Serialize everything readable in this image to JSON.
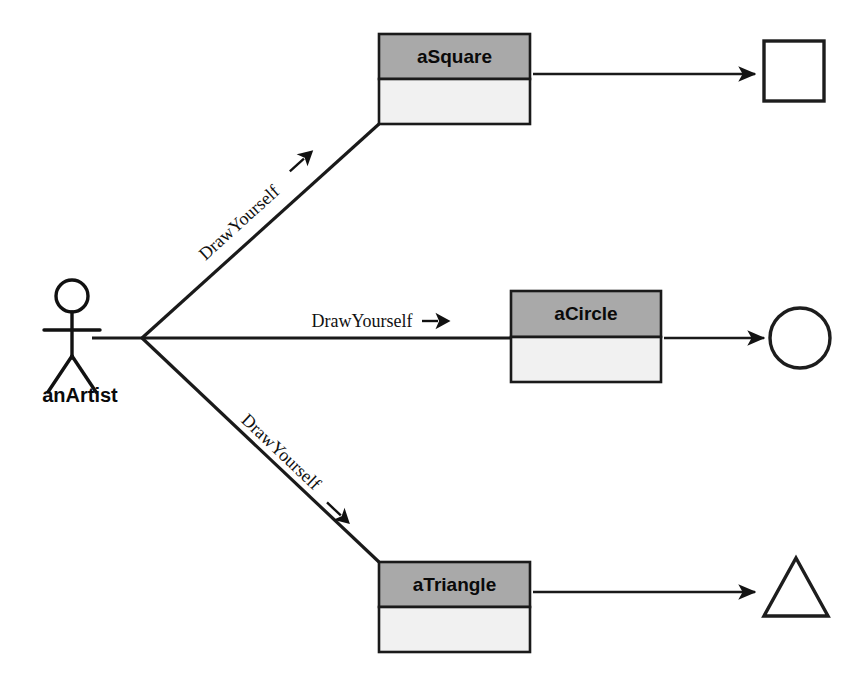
{
  "diagram": {
    "type": "uml-collaboration-diagram",
    "actor": {
      "name": "anArtist",
      "icon": "stick-figure-actor"
    },
    "messages": [
      {
        "id": "msg-square",
        "label": "DrawYourself",
        "target": "aSquare",
        "direction": "up-right"
      },
      {
        "id": "msg-circle",
        "label": "DrawYourself",
        "target": "aCircle",
        "direction": "right"
      },
      {
        "id": "msg-triangle",
        "label": "DrawYourself",
        "target": "aTriangle",
        "direction": "down-right"
      }
    ],
    "objects": [
      {
        "id": "obj-square",
        "title": "aSquare",
        "result_shape": "square",
        "result_icon": "square-icon"
      },
      {
        "id": "obj-circle",
        "title": "aCircle",
        "result_shape": "circle",
        "result_icon": "circle-icon"
      },
      {
        "id": "obj-triangle",
        "title": "aTriangle",
        "result_shape": "triangle",
        "result_icon": "triangle-icon"
      }
    ],
    "colors": {
      "header_fill": "#a9a9a9",
      "body_fill": "#f1f1f1",
      "stroke": "#1a1a1a",
      "background": "#ffffff",
      "text": "#0a0a0a"
    }
  }
}
